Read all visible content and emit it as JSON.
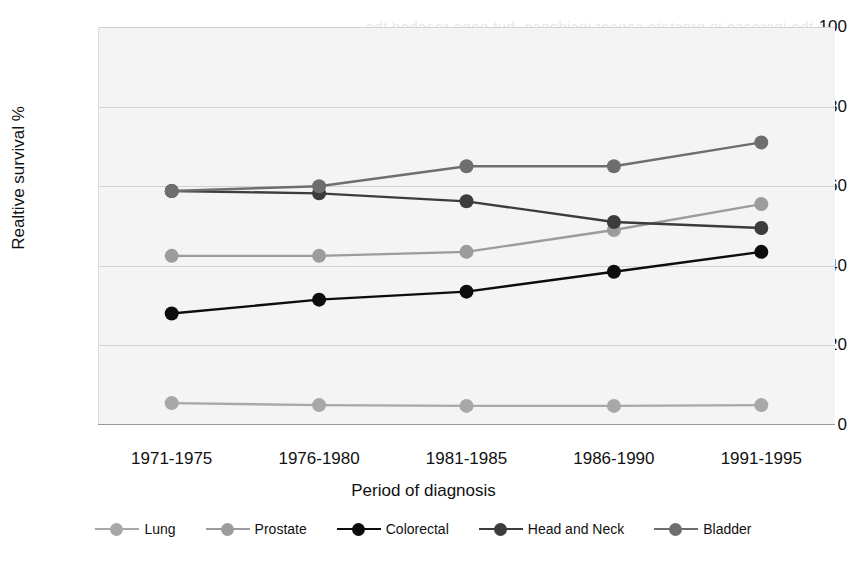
{
  "ghost_text": "in the increase in prostate cancer incidence, but none reached the",
  "chart_data": {
    "type": "line",
    "title": "",
    "xlabel": "Period of diagnosis",
    "ylabel": "Realtive survival %",
    "categories": [
      "1971-1975",
      "1976-1980",
      "1981-1985",
      "1986-1990",
      "1991-1995"
    ],
    "ylim": [
      0,
      100
    ],
    "yticks": [
      0,
      20,
      40,
      60,
      80,
      100
    ],
    "grid": true,
    "legend_position": "bottom",
    "series": [
      {
        "name": "Lung",
        "color": "#a8a8a8",
        "values": [
          5.5,
          5.0,
          4.8,
          4.8,
          5.0
        ]
      },
      {
        "name": "Prostate",
        "color": "#9c9c9c",
        "values": [
          42.5,
          42.5,
          43.5,
          49.0,
          55.5
        ]
      },
      {
        "name": "Colorectal",
        "color": "#0d0d0d",
        "values": [
          28.0,
          31.5,
          33.5,
          38.5,
          43.5
        ]
      },
      {
        "name": "Head and Neck",
        "color": "#3c3c3c",
        "values": [
          58.8,
          58.2,
          56.2,
          51.0,
          49.5
        ]
      },
      {
        "name": "Bladder",
        "color": "#6e6e6e",
        "values": [
          58.8,
          60.0,
          65.0,
          65.0,
          71.0
        ]
      }
    ]
  }
}
